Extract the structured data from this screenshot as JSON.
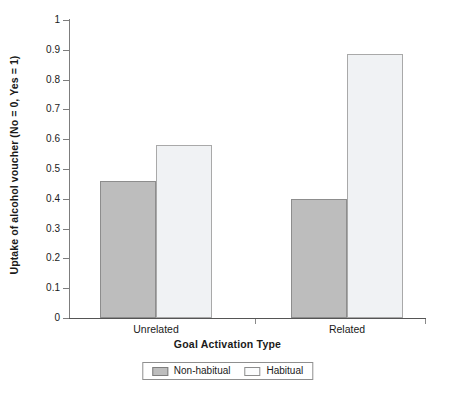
{
  "chart_data": {
    "type": "bar",
    "title": "",
    "xlabel": "Goal Activation Type",
    "ylabel": "Uptake of alcohol voucher (No = 0, Yes = 1)",
    "categories": [
      "Unrelated",
      "Related"
    ],
    "series": [
      {
        "name": "Non-habitual",
        "values": [
          0.46,
          0.4
        ],
        "color": "#bdbdbd"
      },
      {
        "name": "Habitual",
        "values": [
          0.58,
          0.885
        ],
        "color": "#f0f2f4"
      }
    ],
    "ylim": [
      0,
      1
    ],
    "yticks": [
      "0",
      "0.1",
      "0.2",
      "0.3",
      "0.4",
      "0.5",
      "0.6",
      "0.7",
      "0.8",
      "0.9",
      "1"
    ],
    "grid": false,
    "legend_position": "bottom"
  },
  "legend": {
    "items": [
      {
        "label": "Non-habitual"
      },
      {
        "label": "Habitual"
      }
    ]
  }
}
